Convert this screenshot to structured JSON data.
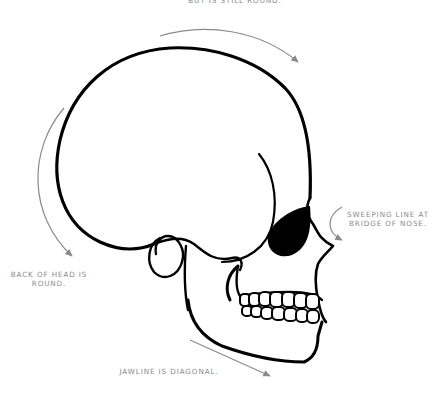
{
  "annotations": {
    "top": {
      "lines": [
        "BUT IS STILL ROUND."
      ]
    },
    "nose": {
      "lines": [
        "SWEEPING LINE AT",
        "BRIDGE OF NOSE."
      ]
    },
    "back": {
      "lines": [
        "BACK OF HEAD IS",
        "ROUND."
      ]
    },
    "jaw": {
      "lines": [
        "JAWLINE IS DIAGONAL."
      ]
    }
  },
  "colors": {
    "ink": "#000000",
    "arrow": "#8a8a8a",
    "text": "#8a8a8a",
    "background": "#ffffff"
  }
}
